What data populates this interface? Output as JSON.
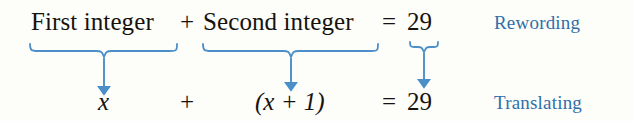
{
  "figure": {
    "background_color": "#fdfdfa",
    "accent_color": "#4a8fc7",
    "text_color": "#16130f",
    "label_color": "#2f6fa8"
  },
  "rewording_row": {
    "term1": "First integer",
    "operator": "+",
    "term2": "Second integer",
    "equals": "=",
    "result": "29",
    "label": "Rewording"
  },
  "translating_row": {
    "term1": "x",
    "operator": "+",
    "term2": "(x + 1)",
    "equals": "=",
    "result": "29",
    "label": "Translating"
  },
  "connectors": [
    {
      "name": "brace-first-integer",
      "arrow": "down"
    },
    {
      "name": "brace-second-integer",
      "arrow": "down"
    },
    {
      "name": "brace-twenty-nine",
      "arrow": "down"
    }
  ]
}
